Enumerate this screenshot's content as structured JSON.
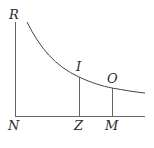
{
  "diagram": {
    "type": "hyperbola-asymptote-figure",
    "stroke_color": "#555555",
    "labels": {
      "R": "R",
      "N": "N",
      "Z": "Z",
      "M": "M",
      "I": "I",
      "O": "O"
    },
    "points": {
      "R": [
        15,
        22
      ],
      "N": [
        15,
        116
      ],
      "Z": [
        79,
        116
      ],
      "M": [
        112,
        116
      ],
      "I": [
        79,
        77
      ],
      "O": [
        112,
        88
      ]
    }
  }
}
